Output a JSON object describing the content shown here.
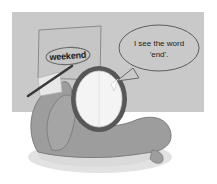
{
  "illustration": {
    "title": "Person holding a mirror up to a card reading weekend",
    "background_panel_color": "#c9c9c9",
    "page_background_color": "#ffffff",
    "skin_color": "#9d9d9d",
    "mirror_rim_color": "#575757",
    "mirror_glass_color": "#f2f2f2",
    "card_color": "#c2c2c2",
    "pointer_color": "#3a3a3a",
    "shadow_color": "#dcdcdc",
    "outline_color": "#6e6e6e",
    "text_color": "#1c1c1c"
  },
  "card": {
    "word_label": "weekend"
  },
  "speech_bubble": {
    "line1": "I see the word",
    "line2": "'end'."
  }
}
